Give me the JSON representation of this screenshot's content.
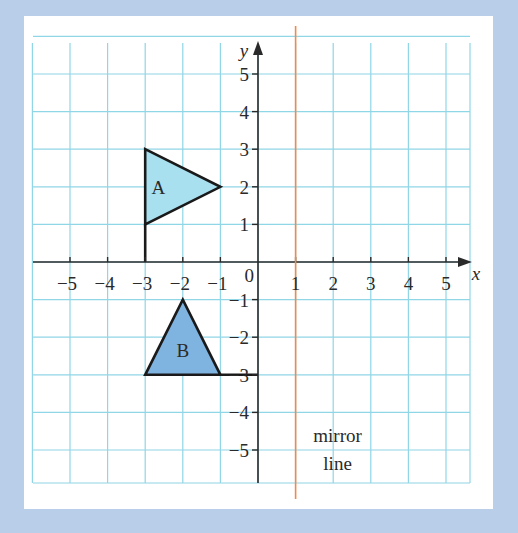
{
  "diagram": {
    "axes": {
      "x_label": "x",
      "y_label": "y",
      "origin_label": "0",
      "x_ticks": [
        {
          "value": -5,
          "label": "−5"
        },
        {
          "value": -4,
          "label": "−4"
        },
        {
          "value": -3,
          "label": "−3"
        },
        {
          "value": -2,
          "label": "−2"
        },
        {
          "value": -1,
          "label": "−1"
        },
        {
          "value": 1,
          "label": "1"
        },
        {
          "value": 2,
          "label": "2"
        },
        {
          "value": 3,
          "label": "3"
        },
        {
          "value": 4,
          "label": "4"
        },
        {
          "value": 5,
          "label": "5"
        }
      ],
      "y_ticks": [
        {
          "value": 5,
          "label": "5"
        },
        {
          "value": 4,
          "label": "4"
        },
        {
          "value": 3,
          "label": "3"
        },
        {
          "value": 2,
          "label": "2"
        },
        {
          "value": 1,
          "label": "1"
        },
        {
          "value": -1,
          "label": "−1"
        },
        {
          "value": -2,
          "label": "−2"
        },
        {
          "value": -3,
          "label": "−3"
        },
        {
          "value": -4,
          "label": "−4"
        },
        {
          "value": -5,
          "label": "−5"
        }
      ],
      "x_range": [
        -6,
        5.6
      ],
      "y_range": [
        -5.9,
        6
      ]
    },
    "shapes": [
      {
        "name": "A",
        "label": "A",
        "vertices": [
          [
            -3,
            3
          ],
          [
            -1,
            2
          ],
          [
            -3,
            1
          ]
        ],
        "fill": "#a8e0f0",
        "flag_pole": [
          [
            -3,
            1
          ],
          [
            -3,
            0
          ]
        ]
      },
      {
        "name": "B",
        "label": "B",
        "vertices": [
          [
            -2,
            -1
          ],
          [
            -1,
            -3
          ],
          [
            -3,
            -3
          ]
        ],
        "fill": "#7fb3e0",
        "flag_pole": [
          [
            -1,
            -3
          ],
          [
            0,
            -3
          ]
        ]
      }
    ],
    "mirror_line": {
      "x": 1,
      "label_line1": "mirror",
      "label_line2": "line",
      "color": "#f08a4b"
    },
    "colors": {
      "background": "#b9cfe9",
      "panel": "#ffffff",
      "grid": "#8fd6e6",
      "axis": "#2a2a2a"
    }
  }
}
